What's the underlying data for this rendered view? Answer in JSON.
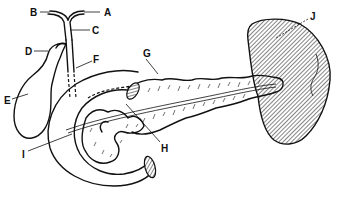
{
  "diagram": {
    "type": "anatomical line drawing",
    "colors": {
      "line": "#111111",
      "background": "#ffffff",
      "hatch": "#555555"
    },
    "labels": [
      {
        "id": "A",
        "text": "A",
        "x": 104,
        "y": 16
      },
      {
        "id": "B",
        "text": "B",
        "x": 30,
        "y": 16
      },
      {
        "id": "C",
        "text": "C",
        "x": 92,
        "y": 33
      },
      {
        "id": "D",
        "text": "D",
        "x": 25,
        "y": 55
      },
      {
        "id": "E",
        "text": "E",
        "x": 6,
        "y": 103
      },
      {
        "id": "F",
        "text": "F",
        "x": 93,
        "y": 65
      },
      {
        "id": "G",
        "text": "G",
        "x": 143,
        "y": 58
      },
      {
        "id": "H",
        "text": "H",
        "x": 163,
        "y": 150
      },
      {
        "id": "I",
        "text": "I",
        "x": 22,
        "y": 155
      },
      {
        "id": "J",
        "text": "J",
        "x": 310,
        "y": 22
      }
    ]
  }
}
